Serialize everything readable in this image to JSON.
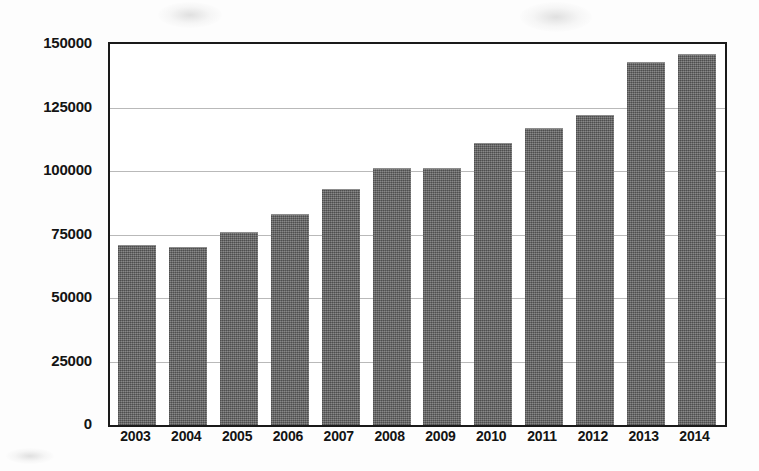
{
  "chart_data": {
    "type": "bar",
    "title": "",
    "subtitle": "",
    "xlabel": "",
    "ylabel": "",
    "categories": [
      "2003",
      "2004",
      "2005",
      "2006",
      "2007",
      "2008",
      "2009",
      "2010",
      "2011",
      "2012",
      "2013",
      "2014"
    ],
    "values": [
      71000,
      70000,
      76000,
      83000,
      93000,
      101000,
      101000,
      111000,
      117000,
      122000,
      143000,
      146000
    ],
    "series": [
      {
        "name": "",
        "values": [
          71000,
          70000,
          76000,
          83000,
          93000,
          101000,
          101000,
          111000,
          117000,
          122000,
          143000,
          146000
        ]
      }
    ],
    "ylim": [
      0,
      150000
    ],
    "y_ticks": [
      0,
      25000,
      50000,
      75000,
      100000,
      125000,
      150000
    ],
    "y_tick_labels": [
      "0",
      "25000",
      "50000",
      "75000",
      "100000",
      "125000",
      "150000"
    ],
    "grid": true,
    "grid_axis": "y",
    "legend": false,
    "legend_position": "none",
    "bar_color": "#6e6e6e",
    "axis_color": "#1a1a1a",
    "gridline_color": "#b9b9b9",
    "background_color": "#ffffff",
    "annotations": []
  }
}
